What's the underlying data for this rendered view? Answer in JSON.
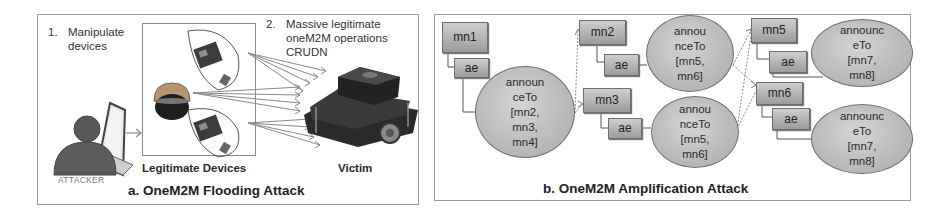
{
  "panel_a": {
    "title": "a. OneM2M Flooding Attack",
    "step1": {
      "number": "1.",
      "line1": "Manipulate",
      "line2": "devices"
    },
    "step2": {
      "number": "2.",
      "line1": "Massive legitimate",
      "line2": "oneM2M operations",
      "line3": "CRUDN"
    },
    "attacker_label": "ATTACKER",
    "devices_label": "Legitimate Devices",
    "victim_label": "Victim",
    "icons": [
      "attacker-person-laptop-icon",
      "iot-board-icon",
      "dome-camera-icon",
      "iot-board-icon",
      "robot-victim-icon"
    ]
  },
  "panel_b": {
    "title": "b. OneM2M Amplification Attack",
    "nodes": {
      "mn1": "mn1",
      "mn2": "mn2",
      "mn3": "mn3",
      "mn5": "mn5",
      "mn6": "mn6",
      "ae": "ae"
    },
    "ellipses": [
      {
        "lines": [
          "announ",
          "ceTo",
          "[mn2,",
          "mn3,",
          "mn4]"
        ]
      },
      {
        "lines": [
          "annou",
          "nceTo",
          "[mn5,",
          "mn6]"
        ]
      },
      {
        "lines": [
          "annou",
          "nceTo",
          "[mn5,",
          "mn6]"
        ]
      },
      {
        "lines": [
          "announc",
          "eTo",
          "[mn7,",
          "mn8]"
        ]
      },
      {
        "lines": [
          "announc",
          "eTo",
          "[mn7,",
          "mn8]"
        ]
      }
    ]
  },
  "colors": {
    "node_fill_top": "#cfcfcf",
    "node_fill_bottom": "#9b9b9b",
    "border": "#6e6e6e",
    "arrow": "#8a8a8a"
  }
}
